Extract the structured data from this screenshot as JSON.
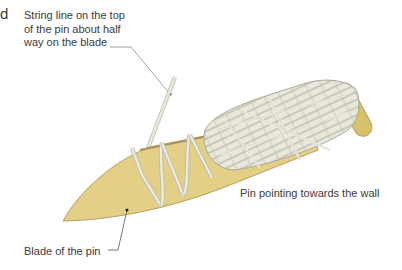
{
  "diagram": {
    "edge_fragment": "d",
    "labels": {
      "string_line": [
        "String line on the top",
        "of the pin about half",
        "way on the blade"
      ],
      "pin_pointing": "Pin pointing towards the wall",
      "blade": "Blade of the pin"
    },
    "colors": {
      "blade_fill": "#e3cf86",
      "blade_edge": "#b79f5e",
      "string": "#ebeade",
      "string_shadow": "#b9b8a8",
      "handle_cap": "#d9c06a",
      "leader_line": "#8a8a8a"
    }
  }
}
